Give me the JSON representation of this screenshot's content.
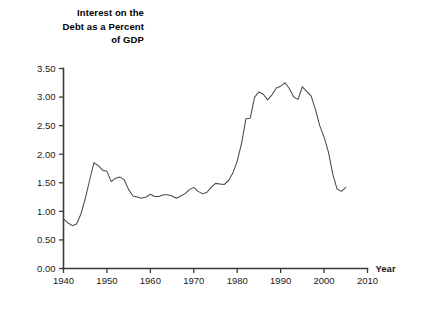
{
  "chart_data": {
    "type": "line",
    "title": "Interest on the\nDebt as a Percent\nof GDP",
    "xlabel": "Year",
    "ylabel": "",
    "xlim": [
      1940,
      2010
    ],
    "ylim": [
      0.0,
      3.5
    ],
    "grid": false,
    "legend": false,
    "xticks": [
      1940,
      1950,
      1960,
      1970,
      1980,
      1990,
      2000,
      2010
    ],
    "xtick_labels": [
      "1940",
      "1950",
      "1960",
      "1970",
      "1980",
      "1990",
      "2000",
      "2010"
    ],
    "yticks": [
      0.0,
      0.5,
      1.0,
      1.5,
      2.0,
      2.5,
      3.0,
      3.5
    ],
    "ytick_labels": [
      "0.00",
      "0.50",
      "1.00",
      "1.50",
      "2.00",
      "2.50",
      "3.00",
      "3.50"
    ],
    "line_color": "#4a4a4a",
    "series": [
      {
        "name": "Interest on the Debt as a Percent of GDP",
        "x": [
          1940,
          1941,
          1942,
          1943,
          1944,
          1945,
          1946,
          1947,
          1948,
          1949,
          1950,
          1951,
          1952,
          1953,
          1954,
          1955,
          1956,
          1957,
          1958,
          1959,
          1960,
          1961,
          1962,
          1963,
          1964,
          1965,
          1966,
          1967,
          1968,
          1969,
          1970,
          1971,
          1972,
          1973,
          1974,
          1975,
          1976,
          1977,
          1978,
          1979,
          1980,
          1981,
          1982,
          1983,
          1984,
          1985,
          1986,
          1987,
          1988,
          1989,
          1990,
          1991,
          1992,
          1993,
          1994,
          1995,
          1996,
          1997,
          1998,
          1999,
          2000,
          2001,
          2002,
          2003,
          2004,
          2005
        ],
        "y": [
          0.87,
          0.8,
          0.75,
          0.78,
          0.95,
          1.22,
          1.54,
          1.85,
          1.8,
          1.72,
          1.7,
          1.52,
          1.58,
          1.6,
          1.55,
          1.38,
          1.27,
          1.25,
          1.23,
          1.25,
          1.3,
          1.26,
          1.26,
          1.29,
          1.29,
          1.27,
          1.23,
          1.27,
          1.31,
          1.38,
          1.42,
          1.35,
          1.31,
          1.33,
          1.42,
          1.49,
          1.48,
          1.47,
          1.54,
          1.67,
          1.88,
          2.19,
          2.62,
          2.63,
          3.0,
          3.09,
          3.05,
          2.95,
          3.04,
          3.16,
          3.19,
          3.25,
          3.15,
          3.0,
          2.96,
          3.18,
          3.1,
          3.02,
          2.79,
          2.5,
          2.3,
          2.04,
          1.65,
          1.39,
          1.35,
          1.42
        ]
      }
    ]
  },
  "axes": {
    "year_label": "Year"
  }
}
